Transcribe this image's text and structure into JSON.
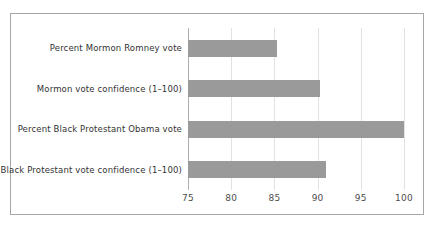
{
  "chart_data": {
    "type": "bar",
    "orientation": "horizontal",
    "title": "",
    "subtitle": "",
    "xlabel": "",
    "ylabel": "",
    "categories": [
      "Percent Mormon Romney vote",
      "Mormon vote confidence (1–100)",
      "Percent Black Protestant Obama vote",
      "Black Protestant vote confidence (1–100)"
    ],
    "values": [
      85.3,
      90.3,
      100.0,
      91.0
    ],
    "xlim": [
      75,
      100
    ],
    "xticks": [
      75,
      80,
      85,
      90,
      95,
      100
    ],
    "xtick_labels": [
      "75",
      "80",
      "85",
      "90",
      "95",
      "100"
    ],
    "grid": true,
    "grid_axis": "x",
    "legend": false,
    "legend_position": "none",
    "series": [
      {
        "name": "",
        "values": [
          85.3,
          90.3,
          100.0,
          91.0
        ]
      }
    ]
  },
  "style": {
    "bar_color": "#9a9a9a",
    "gridline_color": "#e2e2e2",
    "axis_color": "#b0b0b0",
    "frame_color": "#a6a6a6",
    "label_color": "#333333",
    "tick_label_color": "#4d4d4d",
    "background": "#ffffff"
  }
}
